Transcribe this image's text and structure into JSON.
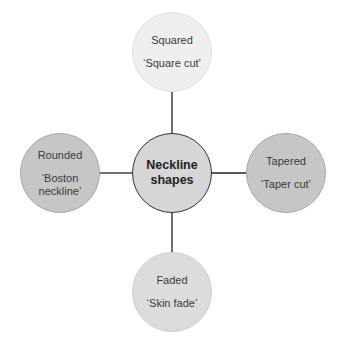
{
  "diagram": {
    "center": {
      "line1": "Neckline",
      "line2": "shapes",
      "fill": "#d6d6d6",
      "border": "#333333"
    },
    "nodes": [
      {
        "id": "top",
        "title": "Squared",
        "subtitle": "‘Square cut’",
        "fill": "#efefef",
        "border": "#dddddd"
      },
      {
        "id": "left",
        "title": "Rounded",
        "subtitle_line1": "‘Boston",
        "subtitle_line2": "neckline’",
        "fill": "#c6c6c6",
        "border": "#aaaaaa"
      },
      {
        "id": "right",
        "title": "Tapered",
        "subtitle": "‘Taper cut’",
        "fill": "#c6c6c6",
        "border": "#aaaaaa"
      },
      {
        "id": "bottom",
        "title": "Faded",
        "subtitle": "‘Skin fade’",
        "fill": "#dcdcdc",
        "border": "#cccccc"
      }
    ],
    "connector_color": "#222222"
  }
}
